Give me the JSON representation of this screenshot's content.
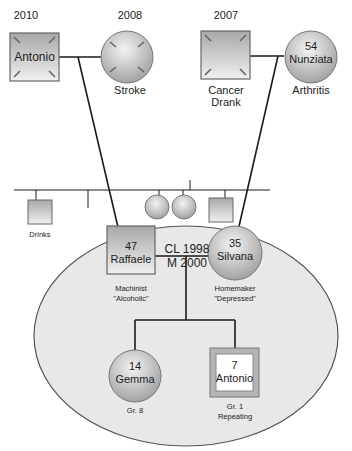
{
  "diagram": {
    "type": "genogram",
    "colors": {
      "line": "#1a1a1a",
      "symbol_fill": "#b9b9b9",
      "household_fill": "#e6e6e6",
      "household_stroke": "#555555"
    },
    "grandparents_paternal": {
      "father": {
        "year": "2010",
        "name": "Antonio",
        "deceased": true,
        "shape": "square"
      },
      "mother": {
        "year": "2008",
        "note": "Stroke",
        "deceased": true,
        "shape": "circle"
      }
    },
    "grandparents_maternal": {
      "father": {
        "year": "2007",
        "note_line1": "Cancer",
        "note_line2": "Drank",
        "deceased": true,
        "shape": "square"
      },
      "mother": {
        "age": "54",
        "name": "Nunziata",
        "note": "Arthritis",
        "shape": "circle"
      }
    },
    "paternal_sibling": {
      "note": "Drinks",
      "shape": "square"
    },
    "maternal_siblings": [
      {
        "shape": "circle"
      },
      {
        "shape": "circle"
      },
      {
        "shape": "square"
      }
    ],
    "couple": {
      "relationship_line1": "CL 1998",
      "relationship_line2": "M 2000",
      "husband": {
        "age": "47",
        "name": "Raffaele",
        "note_line1": "Machinist",
        "note_line2": "\"Alcoholic\"",
        "shape": "square"
      },
      "wife": {
        "age": "35",
        "name": "Silvana",
        "note_line1": "Homemaker",
        "note_line2": "\"Depressed\"",
        "shape": "circle"
      }
    },
    "children": [
      {
        "age": "14",
        "name": "Gemma",
        "note_line1": "Gr. 8",
        "shape": "circle"
      },
      {
        "age": "7",
        "name": "Antonio",
        "note_line1": "Gr. 1",
        "note_line2": "Repeating",
        "shape": "square",
        "identified_patient": true
      }
    ]
  }
}
